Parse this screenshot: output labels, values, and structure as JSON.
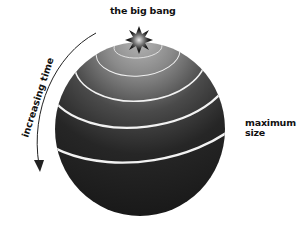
{
  "diagram": {
    "title_label": "the big bang",
    "side_label_line1": "maximum",
    "side_label_line2": "size",
    "arrow_label": "increasing time",
    "arrow_direction": "downward along left edge",
    "rings_count": 5,
    "colors": {
      "sphere_dark": "#1e1e1e",
      "sphere_light": "#9a9a9a",
      "ring": "#f2f2f2",
      "text": "#111111",
      "arrow": "#222222"
    }
  }
}
